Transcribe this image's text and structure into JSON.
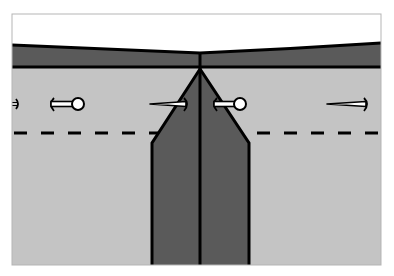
{
  "diagram": {
    "colors": {
      "background": "#ffffff",
      "frame": "#b5b5b5",
      "fabric_light": "#c4c4c4",
      "fabric_dark": "#5a5a5a",
      "outline": "#000000",
      "pin_fill": "#ffffff"
    },
    "elements": {
      "waistband": "waistband",
      "pleat": "box pleat",
      "center_fold": "center fold line",
      "stitch_line": "dashed stitching line",
      "pins": [
        "pin-1",
        "pin-2",
        "pin-3",
        "pin-4",
        "pin-5"
      ]
    }
  }
}
